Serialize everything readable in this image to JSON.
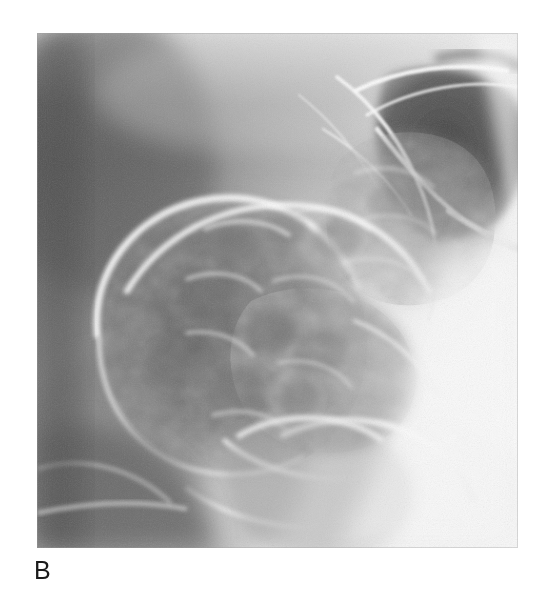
{
  "figure": {
    "panel_label": "B",
    "modality": "radiograph",
    "color_mode": "grayscale",
    "background_color": "#ffffff",
    "image_region": {
      "x": 37,
      "y": 33,
      "width": 481,
      "height": 515
    },
    "tone": {
      "plate_base": "#8d8d8d",
      "darkest_gas": "#3a3a3a",
      "dark_mid": "#5a5a5a",
      "mid": "#909090",
      "light_mid": "#c2c2c2",
      "bright_wall": "#ededed",
      "brightest": "#fbfbfb"
    }
  },
  "icons": {
    "radiograph_plate": "xray-plate-icon"
  }
}
